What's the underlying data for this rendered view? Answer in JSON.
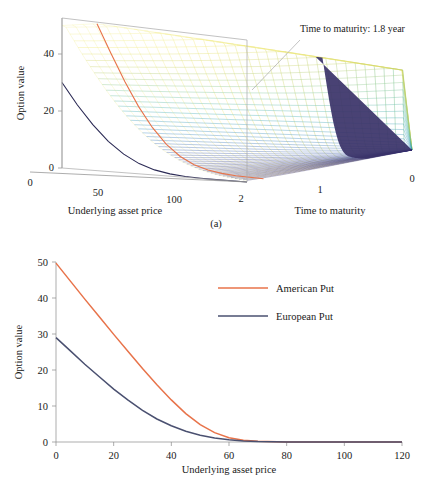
{
  "figure": {
    "caption_a": "(a)",
    "colors": {
      "american": "#E8734A",
      "european": "#4A5070",
      "axis": "#8a8a8a",
      "box": "#a8a8a8",
      "surface_low": "#2b1f66",
      "surface_high": "#f2f09a"
    }
  },
  "chart_data": [
    {
      "type": "line",
      "panel": "a",
      "subtype": "surface-3d-mesh",
      "title": "",
      "xlabel": "Underlying asset price",
      "ylabel": "Time to maturity",
      "zlabel": "Option value",
      "xticks": [
        0,
        50,
        100
      ],
      "yticks": [
        2,
        1,
        0
      ],
      "zticks": [
        0,
        20,
        40
      ],
      "xlim": [
        0,
        120
      ],
      "ylim": [
        2,
        0
      ],
      "zlim": [
        0,
        50
      ],
      "grid": false,
      "legend": "none",
      "annotations": [
        {
          "text": "Time to maturity: 1.8 year",
          "points_to": "upper-right surface edge"
        }
      ],
      "highlight_curves": [
        {
          "name": "American Put at tau = 1.8",
          "color": "#E8734A",
          "x": [
            0,
            10,
            20,
            30,
            40,
            50,
            60,
            70,
            80,
            90,
            100,
            110,
            120
          ],
          "z": [
            50,
            40,
            30.5,
            22,
            15,
            9.5,
            5.6,
            3.1,
            1.6,
            0.8,
            0.35,
            0.15,
            0.05
          ]
        },
        {
          "name": "Payoff at maturity",
          "color": "#2b2a55",
          "x": [
            0,
            10,
            20,
            30,
            40,
            50,
            60,
            70,
            80,
            90,
            100,
            110,
            120
          ],
          "z": [
            30,
            22.5,
            16,
            10.6,
            6.5,
            3.6,
            1.8,
            0.8,
            0.3,
            0.1,
            0.03,
            0.0,
            0.0
          ]
        }
      ]
    },
    {
      "type": "line",
      "panel": "b",
      "title": "",
      "xlabel": "Underlying asset price",
      "ylabel": "Option value",
      "xticks": [
        0,
        20,
        40,
        60,
        80,
        100,
        120
      ],
      "yticks": [
        0,
        10,
        20,
        30,
        40,
        50
      ],
      "xlim": [
        0,
        120
      ],
      "ylim": [
        0,
        50
      ],
      "grid": false,
      "legend_position": "upper-center-right",
      "series": [
        {
          "name": "American Put",
          "color": "#E8734A",
          "x": [
            0,
            5,
            10,
            15,
            20,
            25,
            30,
            35,
            40,
            45,
            50,
            55,
            60,
            65,
            70,
            80,
            90,
            100,
            110,
            120
          ],
          "values": [
            49.7,
            44.7,
            39.7,
            34.8,
            29.9,
            25.1,
            20.4,
            15.9,
            11.7,
            7.9,
            4.8,
            2.6,
            1.2,
            0.5,
            0.2,
            0.04,
            0.01,
            0.0,
            0.0,
            0.0
          ]
        },
        {
          "name": "European Put",
          "color": "#4A5070",
          "x": [
            0,
            5,
            10,
            15,
            20,
            25,
            30,
            35,
            40,
            45,
            50,
            55,
            60,
            65,
            70,
            80,
            90,
            100,
            110,
            120
          ],
          "values": [
            29.0,
            25.3,
            21.6,
            18.1,
            14.7,
            11.6,
            8.8,
            6.4,
            4.5,
            3.0,
            1.9,
            1.1,
            0.6,
            0.3,
            0.15,
            0.03,
            0.01,
            0.0,
            0.0,
            0.0
          ]
        }
      ]
    }
  ]
}
